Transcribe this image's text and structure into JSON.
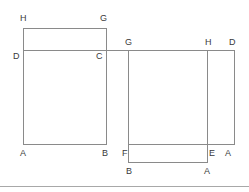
{
  "diagram": {
    "background_color": "#ffffff",
    "stroke_color": "#8a8a8a",
    "label_color": "#3a3a3a",
    "separator_color": "#a8a8a8",
    "stroke_width": 1,
    "canvas": {
      "width": 249,
      "height": 192
    },
    "left_figure": {
      "name": "left-figure",
      "small_rect": {
        "x1": 23,
        "y1": 28,
        "x2": 107,
        "y2": 50
      },
      "large_rect": {
        "x1": 23,
        "y1": 50,
        "x2": 107,
        "y2": 145
      },
      "labels": [
        {
          "id": "left-H",
          "text": "H",
          "x": 20,
          "y": 14
        },
        {
          "id": "left-G",
          "text": "G",
          "x": 100,
          "y": 14
        },
        {
          "id": "left-D",
          "text": "D",
          "x": 13,
          "y": 52
        },
        {
          "id": "left-C",
          "text": "C",
          "x": 96,
          "y": 52
        },
        {
          "id": "left-A",
          "text": "A",
          "x": 20,
          "y": 149
        },
        {
          "id": "left-B",
          "text": "B",
          "x": 102,
          "y": 149
        }
      ]
    },
    "right_figure": {
      "name": "right-figure",
      "main_rect": {
        "x1": 128,
        "y1": 50,
        "x2": 208,
        "y2": 145
      },
      "side_strip": {
        "x1": 208,
        "y1": 50,
        "x2": 235,
        "y2": 145
      },
      "bottom_rect": {
        "x1": 128,
        "y1": 145,
        "x2": 208,
        "y2": 163
      },
      "labels": [
        {
          "id": "right-G",
          "text": "G",
          "x": 125,
          "y": 38
        },
        {
          "id": "right-H",
          "text": "H",
          "x": 205,
          "y": 38
        },
        {
          "id": "right-D",
          "text": "D",
          "x": 229,
          "y": 38
        },
        {
          "id": "right-F",
          "text": "F",
          "x": 122,
          "y": 149
        },
        {
          "id": "right-E",
          "text": "E",
          "x": 209,
          "y": 149
        },
        {
          "id": "right-A-top",
          "text": "A",
          "x": 225,
          "y": 149
        },
        {
          "id": "right-B-bottom",
          "text": "B",
          "x": 126,
          "y": 167
        },
        {
          "id": "right-A-bottom",
          "text": "A",
          "x": 204,
          "y": 167
        }
      ]
    },
    "separator": {
      "y": 186,
      "x1": 0,
      "x2": 249
    }
  }
}
